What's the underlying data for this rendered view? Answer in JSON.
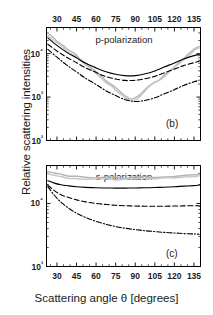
{
  "figure": {
    "ylabel": "Relative scattering intensities",
    "xlabel": "Scattering angle θ [degrees]"
  },
  "chart_data": [
    {
      "type": "line",
      "panel": "(b)",
      "title": "p-polarization",
      "xlabel": "Scattering angle θ [degrees]",
      "ylabel": "Relative scattering intensities",
      "xlim": [
        22,
        140
      ],
      "ylim": [
        100,
        40000
      ],
      "yscale": "log",
      "xticks": [
        30,
        45,
        60,
        75,
        90,
        105,
        120,
        135
      ],
      "xtick_labels": [
        "30",
        "45",
        "60",
        "75",
        "90",
        "105",
        "120",
        "135"
      ],
      "xaxis_position": "top",
      "yticks": [
        100,
        1000,
        10000
      ],
      "ytick_labels": [
        "10²",
        "10³",
        "10⁴"
      ],
      "grid": false,
      "legend": "none",
      "series": [
        {
          "name": "model-solid",
          "style": "solid",
          "color": "#000000",
          "x": [
            23,
            30,
            37,
            45,
            52,
            60,
            67,
            75,
            82,
            86,
            90,
            97,
            105,
            112,
            120,
            127,
            135,
            139
          ],
          "y": [
            23000,
            15500,
            11000,
            8000,
            6000,
            4700,
            3900,
            3350,
            3120,
            3080,
            3120,
            3400,
            4000,
            4900,
            6100,
            7500,
            9000,
            9600
          ]
        },
        {
          "name": "model-dashed",
          "style": "dashed",
          "color": "#000000",
          "x": [
            23,
            30,
            37,
            45,
            52,
            60,
            67,
            75,
            82,
            86,
            90,
            97,
            105,
            112,
            120,
            127,
            135,
            139
          ],
          "y": [
            16500,
            11500,
            8400,
            6200,
            4700,
            3700,
            3000,
            2600,
            2420,
            2400,
            2430,
            2620,
            3000,
            3600,
            4400,
            5300,
            6200,
            6700
          ]
        },
        {
          "name": "model-dash-dot",
          "style": "dash-dot",
          "color": "#000000",
          "x": [
            23,
            30,
            37,
            45,
            52,
            60,
            67,
            75,
            82,
            86,
            90,
            97,
            105,
            112,
            120,
            127,
            135,
            139
          ],
          "y": [
            12500,
            8300,
            5600,
            3800,
            2700,
            1950,
            1430,
            1080,
            880,
            820,
            790,
            830,
            960,
            1180,
            1480,
            1850,
            2250,
            2450
          ]
        },
        {
          "name": "experiment-gray-1",
          "style": "solid",
          "color": "#b4b4b4",
          "x": [
            23,
            27,
            31,
            35,
            39,
            44,
            48,
            52,
            56,
            60,
            64,
            68,
            72,
            76,
            80,
            84,
            87,
            90,
            93,
            96,
            100,
            104,
            108,
            112,
            116,
            120,
            124,
            128,
            132,
            136,
            139
          ],
          "y": [
            30000,
            24000,
            19000,
            15000,
            12000,
            9500,
            7600,
            6000,
            4700,
            3800,
            3000,
            2400,
            1900,
            1500,
            1200,
            1000,
            930,
            940,
            1080,
            1320,
            1750,
            2100,
            2500,
            3100,
            3900,
            5000,
            6400,
            8200,
            10500,
            13000,
            14500
          ]
        },
        {
          "name": "experiment-gray-2",
          "style": "solid",
          "color": "#c8c8c8",
          "x": [
            23,
            27,
            31,
            35,
            39,
            44,
            48,
            52,
            56,
            60,
            64,
            68,
            72,
            76,
            80,
            84,
            87,
            90,
            93,
            96,
            100,
            104,
            108,
            112,
            116,
            120,
            124,
            128,
            132,
            136,
            139
          ],
          "y": [
            26000,
            21000,
            17000,
            13500,
            10800,
            8600,
            6900,
            5400,
            4300,
            3400,
            2700,
            2150,
            1700,
            1350,
            1080,
            900,
            840,
            860,
            1000,
            1250,
            1650,
            2000,
            2400,
            3000,
            3750,
            4800,
            6100,
            7800,
            9900,
            12200,
            13500
          ]
        }
      ]
    },
    {
      "type": "line",
      "panel": "(c)",
      "title": "s-polarization",
      "xlabel": "Scattering angle θ [degrees]",
      "ylabel": "Relative scattering intensities",
      "xlim": [
        22,
        140
      ],
      "ylim": [
        1000,
        40000
      ],
      "yscale": "log",
      "xticks": [
        30,
        45,
        60,
        75,
        90,
        105,
        120,
        135
      ],
      "xtick_labels": [
        "30",
        "45",
        "60",
        "75",
        "90",
        "105",
        "120",
        "135"
      ],
      "xaxis_position": "bottom",
      "yticks": [
        1000,
        10000
      ],
      "ytick_labels": [
        "10³",
        "10⁴"
      ],
      "grid": false,
      "legend": "none",
      "series": [
        {
          "name": "experiment-gray-1",
          "style": "solid",
          "color": "#b4b4b4",
          "x": [
            23,
            28,
            33,
            39,
            45,
            52,
            60,
            68,
            75,
            82,
            90,
            97,
            105,
            112,
            120,
            127,
            135,
            139
          ],
          "y": [
            32000,
            30000,
            28500,
            27500,
            26800,
            26300,
            26000,
            25800,
            25700,
            25700,
            25800,
            26000,
            26300,
            26700,
            27200,
            27800,
            28500,
            29000
          ]
        },
        {
          "name": "experiment-gray-2",
          "style": "solid",
          "color": "#c8c8c8",
          "x": [
            23,
            28,
            33,
            39,
            45,
            52,
            60,
            68,
            75,
            82,
            90,
            97,
            105,
            112,
            120,
            127,
            135,
            139
          ],
          "y": [
            29500,
            27800,
            26500,
            25600,
            25000,
            24600,
            24300,
            24200,
            24200,
            24200,
            24300,
            24500,
            24800,
            25200,
            25700,
            26300,
            27000,
            27500
          ]
        },
        {
          "name": "model-solid",
          "style": "solid",
          "color": "#000000",
          "x": [
            23,
            28,
            33,
            39,
            45,
            52,
            60,
            68,
            75,
            82,
            90,
            97,
            105,
            112,
            120,
            127,
            135,
            139
          ],
          "y": [
            23000,
            21000,
            19800,
            19000,
            18400,
            18000,
            17700,
            17600,
            17500,
            17500,
            17600,
            17700,
            17900,
            18100,
            18400,
            18800,
            19200,
            19500
          ]
        },
        {
          "name": "model-dashed",
          "style": "dashed",
          "color": "#000000",
          "x": [
            23,
            28,
            33,
            39,
            45,
            52,
            60,
            68,
            75,
            82,
            90,
            97,
            105,
            112,
            120,
            127,
            135,
            139
          ],
          "y": [
            19500,
            16000,
            13800,
            12400,
            11400,
            10600,
            10000,
            9600,
            9350,
            9200,
            9100,
            9050,
            9050,
            9050,
            9100,
            9150,
            9200,
            9200
          ]
        },
        {
          "name": "model-dash-dot",
          "style": "dash-dot",
          "color": "#000000",
          "x": [
            23,
            28,
            33,
            39,
            45,
            52,
            60,
            68,
            75,
            82,
            90,
            97,
            105,
            112,
            120,
            127,
            135,
            139
          ],
          "y": [
            18500,
            13500,
            10500,
            8400,
            7000,
            6000,
            5200,
            4650,
            4300,
            4050,
            3850,
            3700,
            3580,
            3480,
            3400,
            3330,
            3280,
            3250
          ]
        }
      ]
    }
  ]
}
